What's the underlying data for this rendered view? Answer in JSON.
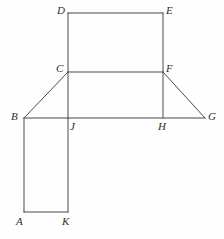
{
  "figure": {
    "canvas": {
      "width": 224,
      "height": 239,
      "background": "#fefefe"
    },
    "stroke_color": "#4a4a4a",
    "stroke_width": 1,
    "label_color": "#2e2e2e",
    "vertices": [
      {
        "id": "A",
        "label": "A",
        "x": 24,
        "y": 212,
        "label_x": 16,
        "label_y": 216
      },
      {
        "id": "B",
        "label": "B",
        "x": 24,
        "y": 118,
        "label_x": 11,
        "label_y": 111
      },
      {
        "id": "C",
        "label": "C",
        "x": 68,
        "y": 72,
        "label_x": 56,
        "label_y": 63
      },
      {
        "id": "D",
        "label": "D",
        "x": 68,
        "y": 13,
        "label_x": 57,
        "label_y": 5
      },
      {
        "id": "E",
        "label": "E",
        "x": 163,
        "y": 13,
        "label_x": 166,
        "label_y": 5
      },
      {
        "id": "F",
        "label": "F",
        "x": 163,
        "y": 72,
        "label_x": 166,
        "label_y": 63
      },
      {
        "id": "G",
        "label": "G",
        "x": 205,
        "y": 118,
        "label_x": 208,
        "label_y": 111
      },
      {
        "id": "H",
        "label": "H",
        "x": 163,
        "y": 118,
        "label_x": 158,
        "label_y": 121
      },
      {
        "id": "J",
        "label": "J",
        "x": 68,
        "y": 118,
        "label_x": 70,
        "label_y": 121
      },
      {
        "id": "K",
        "label": "K",
        "x": 68,
        "y": 212,
        "label_x": 62,
        "label_y": 216
      }
    ],
    "edges": [
      {
        "id": "DE",
        "from": "D",
        "to": "E",
        "name": "edge-d-e"
      },
      {
        "id": "DC",
        "from": "D",
        "to": "C",
        "name": "edge-d-c"
      },
      {
        "id": "EF",
        "from": "E",
        "to": "F",
        "name": "edge-e-f"
      },
      {
        "id": "CF",
        "from": "C",
        "to": "F",
        "name": "edge-c-f"
      },
      {
        "id": "CB",
        "from": "C",
        "to": "B",
        "name": "edge-c-b"
      },
      {
        "id": "FG",
        "from": "F",
        "to": "G",
        "name": "edge-f-g"
      },
      {
        "id": "BG",
        "from": "B",
        "to": "G",
        "name": "edge-b-g"
      },
      {
        "id": "CJ",
        "from": "C",
        "to": "J",
        "name": "edge-c-j"
      },
      {
        "id": "FH",
        "from": "F",
        "to": "H",
        "name": "edge-f-h"
      },
      {
        "id": "BA",
        "from": "B",
        "to": "A",
        "name": "edge-b-a"
      },
      {
        "id": "JK",
        "from": "J",
        "to": "K",
        "name": "edge-j-k"
      },
      {
        "id": "AK",
        "from": "A",
        "to": "K",
        "name": "edge-a-k"
      }
    ]
  }
}
